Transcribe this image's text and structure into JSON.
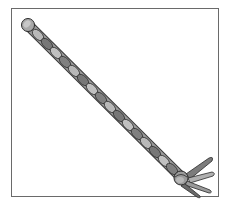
{
  "image": {
    "subject": "twisted-rope",
    "description": "Illustration of a twisted rope with a knotted, frayed end inside a rectangular frame",
    "colors": {
      "rope_light": "#b8b8b8",
      "rope_mid": "#8a8a8a",
      "rope_dark": "#4a4a4a",
      "outline": "#2a2a2a",
      "frame": "#6a6a6a",
      "background": "#ffffff"
    }
  }
}
